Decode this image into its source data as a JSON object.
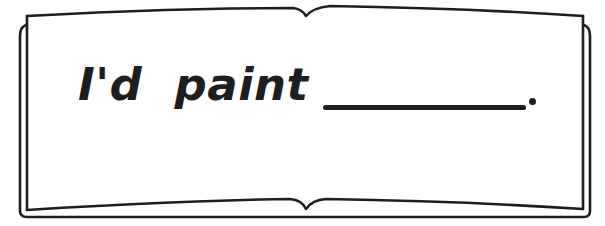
{
  "worksheet": {
    "prompt_text": "I'd  paint",
    "blank": "answer-blank",
    "terminal_punctuation": "."
  },
  "colors": {
    "ink": "#1e1e1e",
    "paper": "#ffffff"
  }
}
